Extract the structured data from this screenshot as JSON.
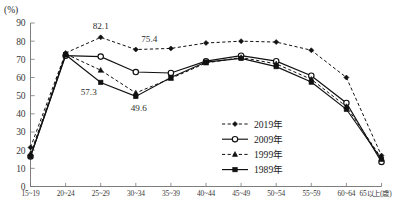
{
  "chart_data": {
    "type": "line",
    "title": "",
    "subtitle": "",
    "xlabel": "",
    "ylabel": "",
    "unit_label": "(%)",
    "x_axis_unit_suffix": "(歳)",
    "categories": [
      "15~19",
      "20~24",
      "25~29",
      "30~34",
      "35~39",
      "40~44",
      "45~49",
      "50~54",
      "55~59",
      "60~64",
      "65以上(歳)"
    ],
    "ylim": [
      0,
      90
    ],
    "yticks": [
      0,
      10,
      20,
      30,
      40,
      50,
      60,
      70,
      80,
      90
    ],
    "grid": false,
    "legend_position": "bottom-right",
    "series": [
      {
        "name": "2019年",
        "marker": "filled-diamond",
        "linestyle": "dashed",
        "color": "#111111",
        "values": [
          21.5,
          73.5,
          82.1,
          75.4,
          76.0,
          79.0,
          80.0,
          79.5,
          75.0,
          60.0,
          17.0
        ]
      },
      {
        "name": "2009年",
        "marker": "open-circle",
        "linestyle": "solid",
        "color": "#111111",
        "values": [
          16.5,
          72.0,
          71.5,
          63.0,
          62.5,
          69.0,
          72.0,
          69.0,
          61.0,
          46.0,
          13.5
        ]
      },
      {
        "name": "1999年",
        "marker": "filled-triangle",
        "linestyle": "dashed",
        "color": "#111111",
        "values": [
          18.0,
          73.0,
          64.0,
          51.5,
          59.5,
          68.0,
          71.0,
          67.5,
          59.0,
          44.0,
          15.5
        ]
      },
      {
        "name": "1989年",
        "marker": "filled-square",
        "linestyle": "solid",
        "color": "#111111",
        "values": [
          16.5,
          72.5,
          57.3,
          49.6,
          60.0,
          68.5,
          70.5,
          66.0,
          57.5,
          42.5,
          15.0
        ]
      }
    ],
    "annotations": [
      {
        "text": "82.1",
        "series": "2019年",
        "category": "25~29",
        "value": 82.1,
        "placement": "above"
      },
      {
        "text": "75.4",
        "series": "2019年",
        "category": "30~34",
        "value": 75.4,
        "placement": "above-right"
      },
      {
        "text": "57.3",
        "series": "1989年",
        "category": "25~29",
        "value": 57.3,
        "placement": "below-left"
      },
      {
        "text": "49.6",
        "series": "1989年",
        "category": "30~34",
        "value": 49.6,
        "placement": "below"
      }
    ]
  },
  "legend": {
    "entries": [
      {
        "label": "2019年"
      },
      {
        "label": "2009年"
      },
      {
        "label": "1999年"
      },
      {
        "label": "1989年"
      }
    ]
  }
}
